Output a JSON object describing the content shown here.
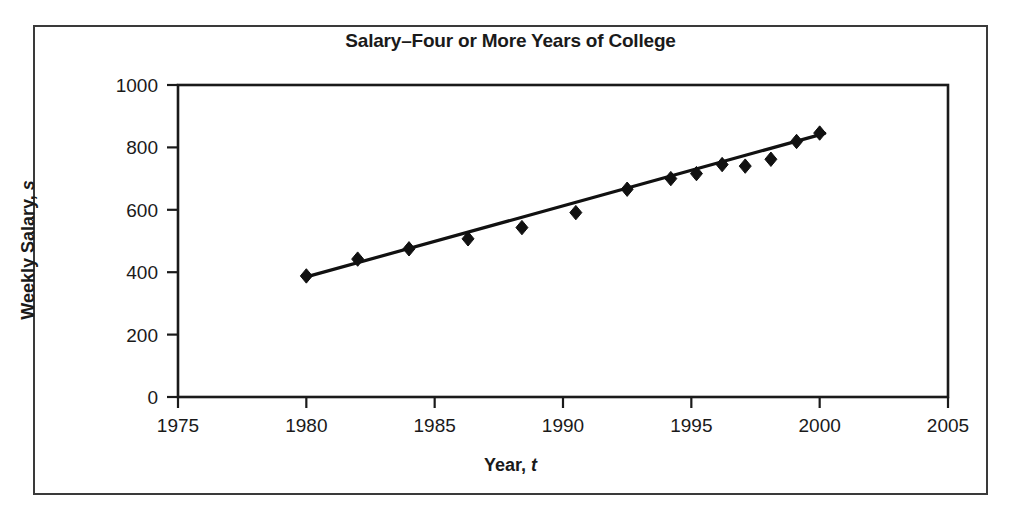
{
  "chart_data": {
    "type": "scatter",
    "title": "Salary–Four or More Years of College",
    "xlabel": "Year, t",
    "xlabel_text": "Year,",
    "xlabel_var": "t",
    "ylabel": "Weekly Salary, s",
    "ylabel_text": "Weekly Salary,",
    "ylabel_var": "s",
    "xlim": [
      1975,
      2005
    ],
    "ylim": [
      0,
      1000
    ],
    "xticks": [
      1975,
      1980,
      1985,
      1990,
      1995,
      2000,
      2005
    ],
    "yticks": [
      0,
      200,
      400,
      600,
      800,
      1000
    ],
    "grid": false,
    "legend": false,
    "marker": "diamond",
    "marker_color": "#111111",
    "line_color": "#111111",
    "points": [
      {
        "x": 1980.0,
        "y": 388
      },
      {
        "x": 1982.0,
        "y": 442
      },
      {
        "x": 1984.0,
        "y": 475
      },
      {
        "x": 1986.3,
        "y": 507
      },
      {
        "x": 1988.4,
        "y": 543
      },
      {
        "x": 1990.5,
        "y": 591
      },
      {
        "x": 1992.5,
        "y": 666
      },
      {
        "x": 1994.2,
        "y": 700
      },
      {
        "x": 1995.2,
        "y": 716
      },
      {
        "x": 1996.2,
        "y": 745
      },
      {
        "x": 1997.1,
        "y": 740
      },
      {
        "x": 1998.1,
        "y": 762
      },
      {
        "x": 1999.1,
        "y": 819
      },
      {
        "x": 2000.0,
        "y": 846
      }
    ],
    "trendline": {
      "name": "linear fit",
      "x_start": 1980.0,
      "y_start": 385,
      "x_end": 2000.2,
      "y_end": 845
    }
  }
}
